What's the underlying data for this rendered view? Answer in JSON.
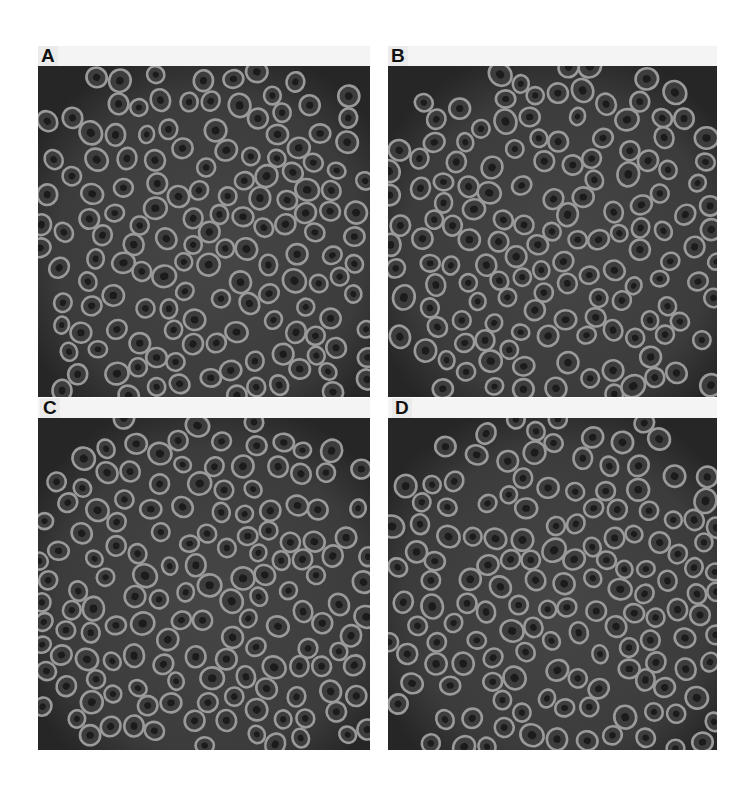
{
  "figure": {
    "panels": [
      {
        "id": "A",
        "label": "A",
        "x": 38,
        "y": 66,
        "w": 332,
        "h": 331,
        "label_x": 38,
        "label_y": 46,
        "seed": 11
      },
      {
        "id": "B",
        "label": "B",
        "x": 388,
        "y": 66,
        "w": 329,
        "h": 331,
        "label_x": 388,
        "label_y": 46,
        "seed": 23
      },
      {
        "id": "C",
        "label": "C",
        "x": 38,
        "y": 418,
        "w": 332,
        "h": 332,
        "label_x": 40,
        "label_y": 398,
        "seed": 37
      },
      {
        "id": "D",
        "label": "D",
        "x": 388,
        "y": 418,
        "w": 329,
        "h": 332,
        "label_x": 392,
        "label_y": 398,
        "seed": 51
      }
    ],
    "style": {
      "background": "#ffffff",
      "panel_bg": "#262626",
      "cluster_bg": "#4a4a4a",
      "ring_color": "#9a9a9a",
      "ring_inner": "#3c3c3c",
      "ring_core": "#1a1a1a"
    }
  }
}
